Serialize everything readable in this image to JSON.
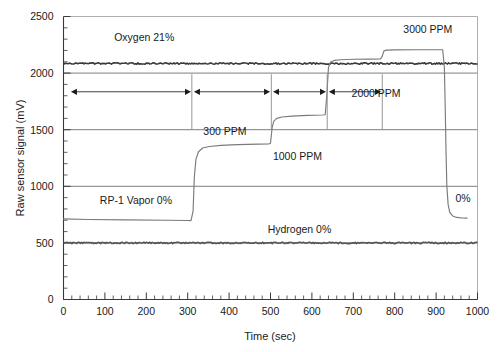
{
  "chart_data": {
    "type": "line",
    "title": "",
    "xlabel": "Time (sec)",
    "ylabel": "Raw sensor signal (mV)",
    "xlim": [
      0,
      1000
    ],
    "ylim": [
      0,
      2500
    ],
    "xticks": [
      0,
      100,
      200,
      300,
      400,
      500,
      600,
      700,
      800,
      900,
      1000
    ],
    "xtick_labels": [
      "0",
      "100",
      "200",
      "300",
      "400",
      "500",
      "600",
      "700",
      "800",
      "900",
      "1000"
    ],
    "x_minor_step": 20,
    "yticks": [
      0,
      500,
      1000,
      1500,
      2000,
      2500
    ],
    "ytick_labels": [
      "0",
      "500",
      "1000",
      "1500",
      "2000",
      "2500"
    ],
    "y_minor_step": 100,
    "grid": "horizontal-major",
    "gridlines_y": [
      500,
      1000,
      1500,
      2000
    ],
    "legend": "inline-annotations",
    "series": [
      {
        "name": "Oxygen 21%",
        "style": "noisy-flat",
        "color": "#3a3a3a",
        "points": [
          [
            0,
            2085
          ],
          [
            1000,
            2085
          ]
        ]
      },
      {
        "name": "Hydrogen 0%",
        "style": "noisy-flat",
        "color": "#555555",
        "points": [
          [
            0,
            500
          ],
          [
            1000,
            500
          ]
        ]
      },
      {
        "name": "RP-1 Vapor",
        "style": "stepped-response",
        "color": "#7a7a7a",
        "points": [
          [
            0,
            712
          ],
          [
            60,
            707
          ],
          [
            150,
            703
          ],
          [
            250,
            700
          ],
          [
            300,
            698
          ],
          [
            308,
            697
          ],
          [
            313,
            780
          ],
          [
            316,
            1080
          ],
          [
            320,
            1240
          ],
          [
            326,
            1305
          ],
          [
            336,
            1338
          ],
          [
            352,
            1352
          ],
          [
            380,
            1362
          ],
          [
            420,
            1368
          ],
          [
            470,
            1372
          ],
          [
            496,
            1374
          ],
          [
            500,
            1380
          ],
          [
            504,
            1520
          ],
          [
            508,
            1575
          ],
          [
            515,
            1600
          ],
          [
            528,
            1612
          ],
          [
            552,
            1620
          ],
          [
            590,
            1626
          ],
          [
            625,
            1630
          ],
          [
            632,
            1632
          ],
          [
            636,
            1800
          ],
          [
            640,
            2050
          ],
          [
            645,
            2098
          ],
          [
            654,
            2112
          ],
          [
            670,
            2118
          ],
          [
            700,
            2122
          ],
          [
            740,
            2124
          ],
          [
            766,
            2125
          ],
          [
            770,
            2150
          ],
          [
            774,
            2196
          ],
          [
            780,
            2203
          ],
          [
            800,
            2205
          ],
          [
            850,
            2206
          ],
          [
            900,
            2206
          ],
          [
            916,
            2206
          ],
          [
            920,
            2050
          ],
          [
            922,
            1700
          ],
          [
            924,
            1300
          ],
          [
            926,
            1000
          ],
          [
            929,
            840
          ],
          [
            933,
            770
          ],
          [
            940,
            738
          ],
          [
            950,
            725
          ],
          [
            962,
            720
          ],
          [
            975,
            719
          ]
        ]
      }
    ],
    "annotations": [
      {
        "name": "oxygen-label",
        "text": "Oxygen 21%",
        "x": 195,
        "y": 2280
      },
      {
        "name": "hydrogen-label",
        "text": "Hydrogen 0%",
        "x": 570,
        "y": 590
      },
      {
        "name": "rp1-label",
        "text": "RP-1 Vapor 0%",
        "x": 175,
        "y": 840
      },
      {
        "name": "ppm-300-label",
        "text": "300 PPM",
        "x": 390,
        "y": 1455
      },
      {
        "name": "ppm-1000-label",
        "text": "1000 PPM",
        "x": 565,
        "y": 1235
      },
      {
        "name": "ppm-2000-label",
        "text": "2000 PPM",
        "x": 755,
        "y": 1790
      },
      {
        "name": "ppm-3000-label",
        "text": "3000 PPM",
        "x": 880,
        "y": 2350
      },
      {
        "name": "zero-percent-label",
        "text": "0%",
        "x": 965,
        "y": 860
      }
    ],
    "interval_markers": {
      "arrow_y_value": 1835,
      "separator_x_values": [
        310,
        502,
        637,
        770
      ],
      "separator_top_value": 1990,
      "separator_bottom_value": 1500,
      "arrows": [
        {
          "name": "interval-0-ppm",
          "x_from": 18,
          "x_to": 308
        },
        {
          "name": "interval-300-ppm",
          "x_from": 315,
          "x_to": 499
        },
        {
          "name": "interval-1000-ppm",
          "x_from": 506,
          "x_to": 634
        },
        {
          "name": "interval-2000-ppm",
          "x_from": 641,
          "x_to": 767
        }
      ]
    }
  }
}
